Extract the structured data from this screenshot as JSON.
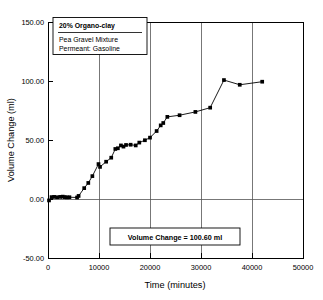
{
  "chart_data": {
    "type": "line",
    "title": "",
    "xlabel": "Time (minutes)",
    "ylabel": "Volume Change (ml)",
    "xlim": [
      0,
      50000
    ],
    "ylim": [
      -50.0,
      150.0
    ],
    "xticks": [
      0,
      10000,
      20000,
      30000,
      40000,
      50000
    ],
    "xticklabels": [
      "0",
      "10000",
      "20000",
      "30000",
      "40000",
      "50000"
    ],
    "yticks": [
      -50.0,
      0.0,
      50.0,
      100.0,
      150.0
    ],
    "yticklabels": [
      "-50.00",
      "0.00",
      "50.00",
      "100.00",
      "150.00"
    ],
    "grid": "vertical gridlines at x ticks plus horizontal line at y=0",
    "legend_position": "upper-left inside axes",
    "marker": "filled square",
    "series": [
      {
        "name": "20% Organo-clay / Pea Gravel Mixture / Permeant: Gasoline",
        "x": [
          200,
          700,
          1200,
          1800,
          2400,
          2900,
          3300,
          3700,
          4200,
          5700,
          6000,
          7100,
          7900,
          8700,
          9900,
          10200,
          11400,
          12400,
          13200,
          13700,
          14300,
          14800,
          15300,
          16200,
          17200,
          17900,
          19000,
          20000,
          21300,
          22100,
          22600,
          23400,
          25800,
          28900,
          31800,
          34500,
          37600,
          42000
        ],
        "y": [
          -1.2,
          1.6,
          1.8,
          1.5,
          1.8,
          2.0,
          1.6,
          1.4,
          1.5,
          1.3,
          2.6,
          9.2,
          13.6,
          19.4,
          29.6,
          27.2,
          31.6,
          35.0,
          42.4,
          43.0,
          45.4,
          44.4,
          45.8,
          46.0,
          45.4,
          47.8,
          49.8,
          52.0,
          57.6,
          62.4,
          64.4,
          69.6,
          71.0,
          73.8,
          77.4,
          100.8,
          96.8,
          99.4
        ]
      }
    ],
    "annotations": [
      {
        "name": "volume-change-callout",
        "text": "Volume Change = 100.60 ml"
      }
    ]
  },
  "legend": {
    "title": "20% Organo-clay",
    "lines": [
      "Pea Gravel Mixture",
      "Permeant: Gasoline"
    ]
  },
  "annotation": {
    "text": "Volume Change = 100.60 ml"
  },
  "axes": {
    "xlabel": "Time (minutes)",
    "ylabel": "Volume Change (ml)"
  },
  "colors": {
    "background": "#ffffff",
    "foreground": "#000000",
    "grid": "#555555",
    "marker": "#000000"
  }
}
